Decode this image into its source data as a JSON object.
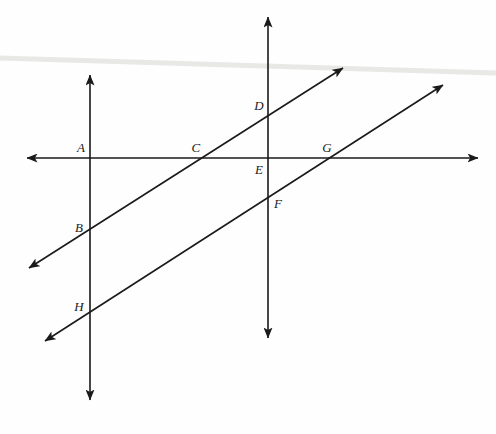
{
  "figure": {
    "width": 496,
    "height": 434,
    "background_color": "#fefefe",
    "stroke_color": "#1a1a1a",
    "stroke_width": 1.6,
    "scan_artifact_color": "#e8e8e6"
  },
  "lines": [
    {
      "id": "horizontal-line",
      "name": "horizontal line",
      "type": "double-arrow",
      "x1": 27,
      "y1": 158,
      "x2": 478,
      "y2": 158
    },
    {
      "id": "vertical-line-left",
      "name": "left vertical line",
      "type": "double-arrow",
      "x1": 90,
      "y1": 75,
      "x2": 90,
      "y2": 400
    },
    {
      "id": "vertical-line-right",
      "name": "right vertical line",
      "type": "double-arrow",
      "x1": 268,
      "y1": 17,
      "x2": 268,
      "y2": 338
    },
    {
      "id": "transversal-upper",
      "name": "upper transversal line",
      "type": "double-arrow",
      "x1": 29,
      "y1": 268,
      "x2": 343,
      "y2": 68
    },
    {
      "id": "transversal-lower",
      "name": "lower transversal line",
      "type": "double-arrow",
      "x1": 45,
      "y1": 341,
      "x2": 443,
      "y2": 85
    }
  ],
  "points": [
    {
      "id": "A",
      "label": "A",
      "x": 90,
      "y": 158,
      "label_x": 81,
      "label_y": 147
    },
    {
      "id": "B",
      "label": "B",
      "x": 90,
      "y": 228,
      "label_x": 79,
      "label_y": 227
    },
    {
      "id": "C",
      "label": "C",
      "x": 201,
      "y": 158,
      "label_x": 196,
      "label_y": 147
    },
    {
      "id": "D",
      "label": "D",
      "x": 268,
      "y": 112,
      "label_x": 259,
      "label_y": 105
    },
    {
      "id": "E",
      "label": "E",
      "x": 268,
      "y": 158,
      "label_x": 259,
      "label_y": 169
    },
    {
      "id": "F",
      "label": "F",
      "x": 268,
      "y": 198,
      "label_x": 278,
      "label_y": 203
    },
    {
      "id": "G",
      "label": "G",
      "x": 331,
      "y": 158,
      "label_x": 327,
      "label_y": 147
    },
    {
      "id": "H",
      "label": "H",
      "x": 90,
      "y": 310,
      "label_x": 79,
      "label_y": 306
    }
  ]
}
